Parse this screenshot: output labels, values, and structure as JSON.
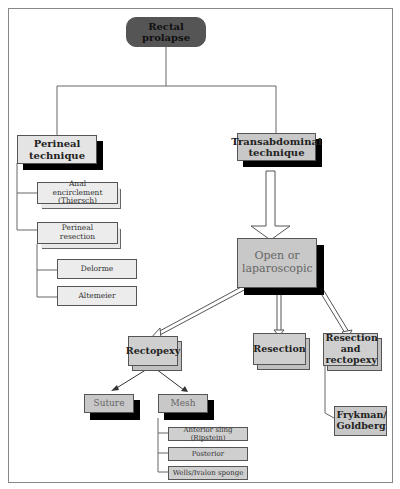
{
  "diagram": {
    "root": {
      "label": "Rectal prolapse"
    },
    "perineal": {
      "label": "Perineal technique",
      "children": [
        {
          "label": "Anal encirclement (Thiersch)"
        },
        {
          "label": "Perineal resection",
          "children": [
            {
              "label": "Delorme"
            },
            {
              "label": "Altemeier"
            }
          ]
        }
      ]
    },
    "transabdominal": {
      "label": "Transabdominal technique",
      "approach": {
        "label": "Open or laparoscopic"
      },
      "children": [
        {
          "label": "Rectopexy",
          "children": [
            {
              "label": "Suture"
            },
            {
              "label": "Mesh",
              "children": [
                {
                  "label": "Anterior sling (Ripstein)"
                },
                {
                  "label": "Posterior"
                },
                {
                  "label": "Wells/Ivalon sponge"
                }
              ]
            }
          ]
        },
        {
          "label": "Resection"
        },
        {
          "label": "Resection and rectopexy",
          "children": [
            {
              "label": "Frykman/ Goldberg"
            }
          ]
        }
      ]
    }
  },
  "colors": {
    "root_fill": "#555555",
    "gray_fill": "#c8c8c8",
    "light_fill": "#e4e4e4",
    "shadow": "#000000"
  }
}
